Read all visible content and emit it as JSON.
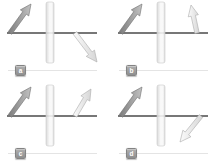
{
  "figure": {
    "background": "#ffffff",
    "colors": {
      "surface_line": "#4a4a4a",
      "slab_fill_edge": "#d5d5d5",
      "slab_fill_center": "#f8f8f8",
      "slab_border": "#c9c9c9",
      "incident_arrow_dark": "#7c7c7c",
      "incident_arrow_light": "#c2c2c2",
      "incident_arrow_stroke": "#6f6f6f",
      "transmitted_arrow_light": "#fbfbfb",
      "transmitted_arrow_dark": "#d6d6d6",
      "transmitted_arrow_stroke": "#ababab",
      "label_badge_bg_top": "#b0b0b0",
      "label_badge_bg_bottom": "#8e8e8e",
      "label_badge_border": "#838383",
      "label_badge_text": "#ffffff",
      "label_rule": "#e4e4e4"
    },
    "geometry": {
      "panel_w": 111,
      "panel_h": 83,
      "line": {
        "x1": 7,
        "x2": 97,
        "y": 33,
        "width": 1.6
      },
      "slab": {
        "x": 46,
        "y": 2,
        "w": 8,
        "h": 61,
        "rx": 2
      },
      "arrow": {
        "shaft_half_w": 2.2,
        "head_half_w": 5.2,
        "head_len": 11
      }
    },
    "panels": [
      {
        "label": "a",
        "incident": {
          "tail": [
            10,
            33
          ],
          "tip": [
            31,
            4
          ],
          "direction": "up-right"
        },
        "transmitted": {
          "tail": [
            75,
            33
          ],
          "tip": [
            97,
            62
          ],
          "direction": "down-right"
        }
      },
      {
        "label": "b",
        "incident": {
          "tail": [
            10,
            33
          ],
          "tip": [
            31,
            4
          ],
          "direction": "up-right"
        },
        "transmitted": {
          "tail": [
            86,
            33
          ],
          "tip": [
            80,
            5
          ],
          "direction": "up-steep"
        }
      },
      {
        "label": "c",
        "incident": {
          "tail": [
            10,
            33
          ],
          "tip": [
            31,
            4
          ],
          "direction": "up-right"
        },
        "transmitted": {
          "tail": [
            75,
            33
          ],
          "tip": [
            91,
            6
          ],
          "direction": "up-right-parallel"
        }
      },
      {
        "label": "d",
        "incident": {
          "tail": [
            10,
            33
          ],
          "tip": [
            31,
            4
          ],
          "direction": "up-right"
        },
        "transmitted": {
          "tail": [
            90,
            33
          ],
          "tip": [
            69,
            59
          ],
          "direction": "down-left"
        }
      }
    ]
  }
}
